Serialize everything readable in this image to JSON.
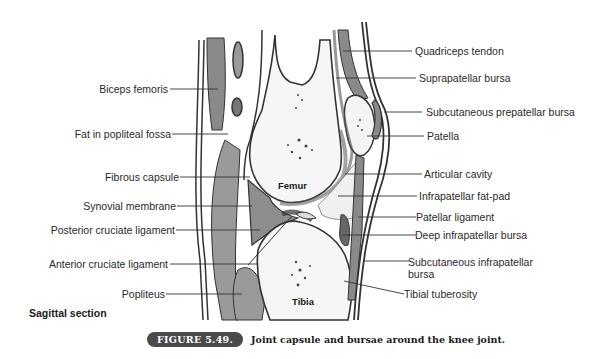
{
  "figure": {
    "number_badge": "FIGURE 5.49.",
    "caption": "Joint capsule and bursae around the knee joint.",
    "section_title": "Sagittal section",
    "badge_color": "#4a4a4a"
  },
  "bones": {
    "femur": "Femur",
    "tibia": "Tibia"
  },
  "labels_left": [
    {
      "id": "biceps-femoris",
      "text": "Biceps femoris"
    },
    {
      "id": "fat-in-popliteal-fossa",
      "text": "Fat in popliteal fossa"
    },
    {
      "id": "fibrous-capsule",
      "text": "Fibrous capsule"
    },
    {
      "id": "synovial-membrane",
      "text": "Synovial membrane"
    },
    {
      "id": "posterior-cruciate-ligament",
      "text": "Posterior cruciate ligament"
    },
    {
      "id": "anterior-cruciate-ligament",
      "text": "Anterior cruciate ligament"
    },
    {
      "id": "popliteus",
      "text": "Popliteus"
    }
  ],
  "labels_right": [
    {
      "id": "quadriceps-tendon",
      "text": "Quadriceps tendon"
    },
    {
      "id": "suprapatellar-bursa",
      "text": "Suprapatellar bursa"
    },
    {
      "id": "subcutaneous-prepatellar-bursa",
      "text": "Subcutaneous prepatellar bursa"
    },
    {
      "id": "patella",
      "text": "Patella"
    },
    {
      "id": "articular-cavity",
      "text": "Articular cavity"
    },
    {
      "id": "infrapatellar-fat-pad",
      "text": "Infrapatellar fat-pad"
    },
    {
      "id": "patellar-ligament",
      "text": "Patellar ligament"
    },
    {
      "id": "deep-infrapatellar-bursa",
      "text": "Deep infrapatellar bursa"
    },
    {
      "id": "subcutaneous-infrapatellar-bursa",
      "text": "Subcutaneous infrapatellar bursa"
    },
    {
      "id": "tibial-tuberosity",
      "text": "Tibial tuberosity"
    }
  ]
}
